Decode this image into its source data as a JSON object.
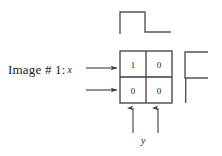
{
  "figure": {
    "caption_prefix": "Image # 1:",
    "input_signal_name": "x",
    "output_signal_name": "y"
  },
  "matrix": {
    "rows": [
      [
        "1",
        "0"
      ],
      [
        "0",
        "0"
      ]
    ],
    "row_count": 2,
    "column_count": 2,
    "border_color": "#3d3d3d"
  },
  "waveforms": {
    "top": {
      "name": "top-step-waveform",
      "color": "#555555",
      "description": "rising step then falling step",
      "points": "120,34 120,12 145,12 145,32 171,32"
    },
    "right": {
      "name": "right-step-waveform",
      "color": "#555555",
      "description": "rotated step profile",
      "points": "208,52 185,52 185,78 208,78"
    }
  },
  "arrows": {
    "input": [
      {
        "name": "input-arrow-row-0",
        "x1": 86,
        "y1": 68,
        "x2": 118,
        "y2": 68
      },
      {
        "name": "input-arrow-row-1",
        "x1": 86,
        "y1": 90,
        "x2": 118,
        "y2": 90
      }
    ],
    "output": [
      {
        "name": "output-arrow-col-0",
        "x1": 133,
        "y1": 133,
        "x2": 133,
        "y2": 107
      },
      {
        "name": "output-arrow-col-1",
        "x1": 158,
        "y1": 133,
        "x2": 158,
        "y2": 107
      }
    ],
    "color": "#3d3d3d"
  }
}
